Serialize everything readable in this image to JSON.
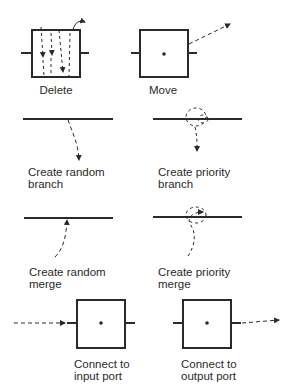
{
  "panels": [
    {
      "id": "delete",
      "label_lines": [
        "Delete"
      ]
    },
    {
      "id": "move",
      "label_lines": [
        "Move"
      ]
    },
    {
      "id": "create-random-branch",
      "label_lines": [
        "Create random",
        "branch"
      ]
    },
    {
      "id": "create-priority-branch",
      "label_lines": [
        "Create priority",
        "branch"
      ]
    },
    {
      "id": "create-random-merge",
      "label_lines": [
        "Create random",
        "merge"
      ]
    },
    {
      "id": "create-priority-merge",
      "label_lines": [
        "Create priority",
        "merge"
      ]
    },
    {
      "id": "connect-to-input-port",
      "label_lines": [
        "Connect to",
        "input port"
      ]
    },
    {
      "id": "connect-to-output-port",
      "label_lines": [
        "Connect to",
        "output port"
      ]
    }
  ],
  "colors": {
    "ink": "#2a2a2a",
    "background": "#ffffff"
  }
}
